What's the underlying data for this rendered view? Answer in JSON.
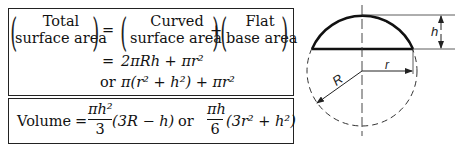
{
  "surface_area": {
    "lhs": {
      "line1": "Total",
      "line2": "surface area"
    },
    "equals": "=",
    "term1": {
      "line1": "Curved",
      "line2": "surface area"
    },
    "plus": "+",
    "term2": {
      "line1": "Flat",
      "line2": "base area"
    },
    "formula1": {
      "eq": "=",
      "expr": "2πRh + πr²"
    },
    "formula2": {
      "or": "or",
      "expr": "π(r² + h²) + πr²"
    }
  },
  "volume": {
    "label": "Volume",
    "equals": "=",
    "frac1": {
      "num": "πh²",
      "den": "3",
      "tail": "(3R − h)"
    },
    "or": "or",
    "frac2": {
      "num": "πh",
      "den": "6",
      "tail": "(3r² + h²)"
    }
  },
  "diagram": {
    "labels": {
      "h": "h",
      "r": "r",
      "R": "R"
    },
    "colors": {
      "stroke": "#222222"
    }
  }
}
